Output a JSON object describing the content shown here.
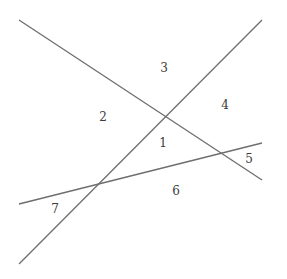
{
  "diagram": {
    "stroke_color": "#6e6e6e",
    "label_color": "#3a3a3a",
    "lines": [
      {
        "id": "line-a",
        "x1": 19,
        "y1": 20,
        "x2": 262,
        "y2": 180
      },
      {
        "id": "line-b",
        "x1": 19,
        "y1": 264,
        "x2": 262,
        "y2": 20
      },
      {
        "id": "line-c",
        "x1": 19,
        "y1": 204,
        "x2": 262,
        "y2": 143
      }
    ],
    "regions": [
      {
        "label": "1",
        "x": 163,
        "y": 147
      },
      {
        "label": "2",
        "x": 103,
        "y": 121
      },
      {
        "label": "3",
        "x": 164,
        "y": 72
      },
      {
        "label": "4",
        "x": 225,
        "y": 109
      },
      {
        "label": "5",
        "x": 249,
        "y": 163
      },
      {
        "label": "6",
        "x": 176,
        "y": 195
      },
      {
        "label": "7",
        "x": 55,
        "y": 213
      }
    ]
  }
}
